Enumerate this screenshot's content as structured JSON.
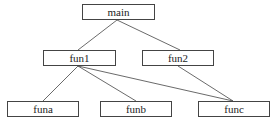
{
  "diagram": {
    "type": "call-tree",
    "nodes": [
      {
        "id": "main",
        "label": "main",
        "x": 82,
        "y": 4,
        "w": 73,
        "h": 16
      },
      {
        "id": "fun1",
        "label": "fun1",
        "x": 43,
        "y": 50,
        "w": 73,
        "h": 16
      },
      {
        "id": "fun2",
        "label": "fun2",
        "x": 142,
        "y": 50,
        "w": 72,
        "h": 16
      },
      {
        "id": "funa",
        "label": "funa",
        "x": 7,
        "y": 101,
        "w": 72,
        "h": 16
      },
      {
        "id": "funb",
        "label": "funb",
        "x": 100,
        "y": 101,
        "w": 72,
        "h": 16
      },
      {
        "id": "func",
        "label": "func",
        "x": 198,
        "y": 101,
        "w": 72,
        "h": 16
      }
    ],
    "edges": [
      {
        "from": "main",
        "to": "fun1"
      },
      {
        "from": "main",
        "to": "fun2"
      },
      {
        "from": "fun1",
        "to": "funa"
      },
      {
        "from": "fun1",
        "to": "funb"
      },
      {
        "from": "fun1",
        "to": "func"
      },
      {
        "from": "fun2",
        "to": "func"
      }
    ],
    "colors": {
      "stroke": "#444444",
      "text": "#222222",
      "background": "#ffffff"
    }
  }
}
